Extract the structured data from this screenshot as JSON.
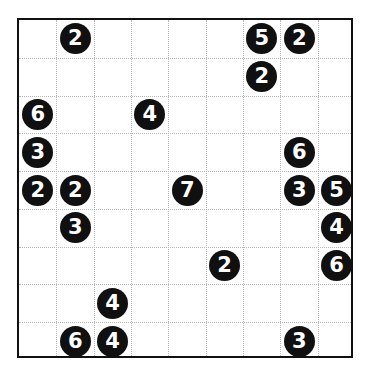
{
  "puzzle": {
    "title": "Number grid puzzle",
    "grid": {
      "columns": 9,
      "rows": 9,
      "border_color": "#111111",
      "gridline_color": "#b9b9b9",
      "background_color": "#ffffff",
      "left": 17,
      "top": 18,
      "width": 336,
      "height": 340
    },
    "clue_style": {
      "shape": "circle",
      "fill_color": "#101010",
      "text_color": "#ffffff"
    },
    "clues": [
      {
        "value": "2",
        "row": 0,
        "col": 1
      },
      {
        "value": "5",
        "row": 0,
        "col": 6
      },
      {
        "value": "2",
        "row": 0,
        "col": 7
      },
      {
        "value": "2",
        "row": 1,
        "col": 6
      },
      {
        "value": "6",
        "row": 2,
        "col": 0
      },
      {
        "value": "4",
        "row": 2,
        "col": 3
      },
      {
        "value": "3",
        "row": 3,
        "col": 0
      },
      {
        "value": "6",
        "row": 3,
        "col": 7
      },
      {
        "value": "2",
        "row": 4,
        "col": 0
      },
      {
        "value": "2",
        "row": 4,
        "col": 1
      },
      {
        "value": "7",
        "row": 4,
        "col": 4
      },
      {
        "value": "3",
        "row": 4,
        "col": 7
      },
      {
        "value": "5",
        "row": 4,
        "col": 8
      },
      {
        "value": "3",
        "row": 5,
        "col": 1
      },
      {
        "value": "4",
        "row": 5,
        "col": 8
      },
      {
        "value": "2",
        "row": 6,
        "col": 5
      },
      {
        "value": "6",
        "row": 6,
        "col": 8
      },
      {
        "value": "4",
        "row": 7,
        "col": 2
      },
      {
        "value": "6",
        "row": 8,
        "col": 1
      },
      {
        "value": "4",
        "row": 8,
        "col": 2
      },
      {
        "value": "3",
        "row": 8,
        "col": 7
      }
    ]
  }
}
